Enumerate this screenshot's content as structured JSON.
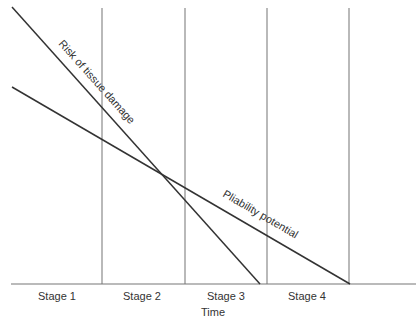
{
  "diagram": {
    "xlabel": "Time",
    "stages": [
      {
        "label": "Stage 1"
      },
      {
        "label": "Stage 2"
      },
      {
        "label": "Stage 3"
      },
      {
        "label": "Stage 4"
      }
    ],
    "lines": [
      {
        "name": "Risk of tissue damage",
        "label": "Risk of tissue damage"
      },
      {
        "name": "Pliability potential",
        "label": "Pliability potential"
      }
    ],
    "colors": {
      "line": "#333333",
      "divider": "#777777",
      "text": "#333333"
    }
  }
}
